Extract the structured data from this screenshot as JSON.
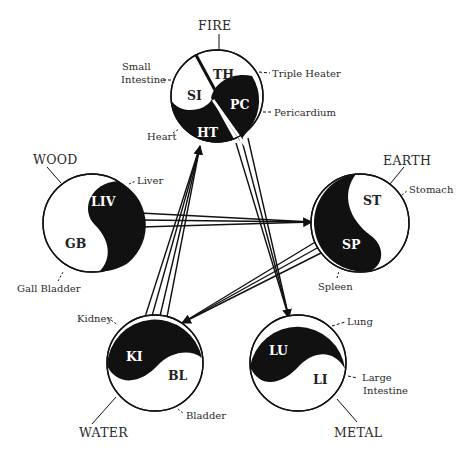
{
  "diagram": {
    "title": "",
    "colors": {
      "ink": "#111111",
      "paper": "#ffffff",
      "text": "#2a2a2a"
    },
    "elements": [
      {
        "id": "fire",
        "label": "FIRE",
        "organs": [
          {
            "abbr": "TH",
            "name": "Triple Heater"
          },
          {
            "abbr": "SI",
            "name": "Small Intestine"
          },
          {
            "abbr": "PC",
            "name": "Pericardium"
          },
          {
            "abbr": "HT",
            "name": "Heart"
          }
        ]
      },
      {
        "id": "earth",
        "label": "EARTH",
        "organs": [
          {
            "abbr": "ST",
            "name": "Stomach"
          },
          {
            "abbr": "SP",
            "name": "Spleen"
          }
        ]
      },
      {
        "id": "metal",
        "label": "METAL",
        "organs": [
          {
            "abbr": "LU",
            "name": "Lung"
          },
          {
            "abbr": "LI",
            "name": "Large Intestine"
          }
        ]
      },
      {
        "id": "water",
        "label": "WATER",
        "organs": [
          {
            "abbr": "KI",
            "name": "Kidney"
          },
          {
            "abbr": "BL",
            "name": "Bladder"
          }
        ]
      },
      {
        "id": "wood",
        "label": "WOOD",
        "organs": [
          {
            "abbr": "LIV",
            "name": "Liver"
          },
          {
            "abbr": "GB",
            "name": "Gall Bladder"
          }
        ]
      }
    ],
    "organ_labels": {
      "small_intestine_1": "Small",
      "small_intestine_2": "Intestine",
      "large_intestine_1": "Large",
      "large_intestine_2": "Intestine"
    },
    "connections": [
      {
        "from": "wood",
        "to": "earth"
      },
      {
        "from": "earth",
        "to": "water"
      },
      {
        "from": "water",
        "to": "fire"
      },
      {
        "from": "fire",
        "to": "metal"
      }
    ]
  }
}
